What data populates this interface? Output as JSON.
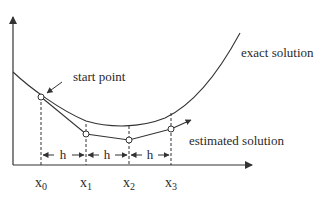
{
  "diagram": {
    "title": "",
    "labels": {
      "exact": "exact solution",
      "estimated": "estimated solution",
      "start": "start point",
      "step": "h"
    },
    "x_ticks": [
      {
        "base": "x",
        "sub": "0"
      },
      {
        "base": "x",
        "sub": "1"
      },
      {
        "base": "x",
        "sub": "2"
      },
      {
        "base": "x",
        "sub": "3"
      }
    ],
    "colors": {
      "line": "#333333",
      "text": "#2a2a2a",
      "background": "#ffffff"
    }
  }
}
